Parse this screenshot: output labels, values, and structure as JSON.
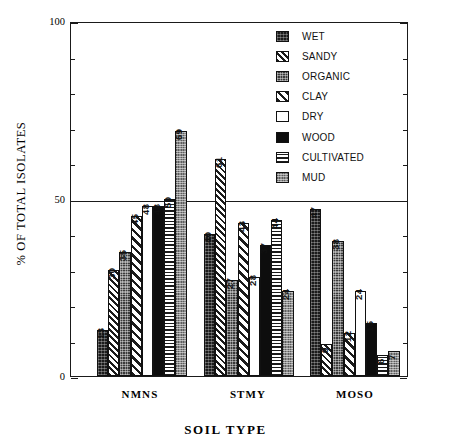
{
  "chart_data": {
    "type": "bar",
    "title": "",
    "xlabel": "SOIL TYPE",
    "ylabel": "% OF TOTAL ISOLATES",
    "categories": [
      "NMNS",
      "STMY",
      "MOSO"
    ],
    "ylim": [
      0,
      100
    ],
    "yticks": [
      0,
      50,
      100
    ],
    "ytick_labels": [
      "0",
      "50",
      "100"
    ],
    "yminor_tick_interval": 10,
    "grid": false,
    "reference_line_y": 50,
    "legend_position": "top-right",
    "series": [
      {
        "name": "WET",
        "pattern": "p-wet",
        "values": [
          13,
          40,
          47
        ]
      },
      {
        "name": "SANDY",
        "pattern": "p-sandy",
        "values": [
          30,
          61,
          9
        ]
      },
      {
        "name": "ORGANIC",
        "pattern": "p-organic",
        "values": [
          35,
          27,
          38
        ]
      },
      {
        "name": "CLAY",
        "pattern": "p-clay",
        "values": [
          45,
          43,
          12
        ]
      },
      {
        "name": "DRY",
        "pattern": "p-dry",
        "values": [
          48,
          28,
          24
        ]
      },
      {
        "name": "WOOD",
        "pattern": "p-wood",
        "values": [
          48,
          37,
          15
        ]
      },
      {
        "name": "CULTIVATED",
        "pattern": "p-cultivated",
        "values": [
          50,
          44,
          6
        ]
      },
      {
        "name": "MUD",
        "pattern": "p-mud",
        "values": [
          69,
          24,
          7
        ]
      }
    ]
  },
  "axis": {
    "y_title": "% OF TOTAL ISOLATES",
    "x_title": "SOIL TYPE",
    "y_max_label": "100",
    "y_mid_label": "50",
    "y_min_label": "0"
  },
  "legend": {
    "items": [
      {
        "label": "WET",
        "swatch": "p-wet"
      },
      {
        "label": "SANDY",
        "swatch": "p-sandy"
      },
      {
        "label": "ORGANIC",
        "swatch": "p-organic"
      },
      {
        "label": "CLAY",
        "swatch": "p-clay"
      },
      {
        "label": "DRY",
        "swatch": "p-dry"
      },
      {
        "label": "WOOD",
        "swatch": "p-wood"
      },
      {
        "label": "CULTIVATED",
        "swatch": "p-cultivated"
      },
      {
        "label": "MUD",
        "swatch": "p-mud"
      }
    ]
  },
  "colors": {
    "axis": "#1a1a1a",
    "background": "#ffffff",
    "ink": "#111111",
    "mud_gray": "#8c8c8c",
    "organic_gray": "#3a3a3a"
  }
}
